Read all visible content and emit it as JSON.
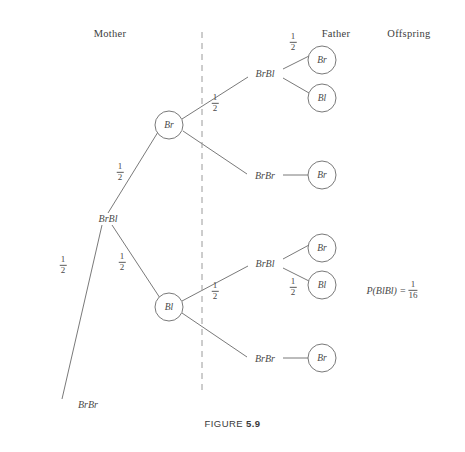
{
  "figure": {
    "caption_word": "FIGURE",
    "caption_number": "5.9"
  },
  "headers": [
    {
      "label": "Mother",
      "x": 110,
      "y": 28
    },
    {
      "label": "Father",
      "x": 336,
      "y": 28
    },
    {
      "label": "Offspring",
      "x": 409,
      "y": 28
    }
  ],
  "divider": {
    "name": "mother-father-divider",
    "x": 202,
    "y1": 32,
    "y2": 392
  },
  "probability": {
    "expression": "P(BlBl)",
    "equals": "=",
    "numerator": "1",
    "denominator": "16",
    "x": 392,
    "y": 290
  },
  "nodes": [
    {
      "id": "mother-genotype",
      "label": "BrBl",
      "x": 108,
      "y": 218,
      "shape": "text"
    },
    {
      "id": "mother-gamete-br",
      "label": "Br",
      "x": 169,
      "y": 125,
      "shape": "circle",
      "r": 14
    },
    {
      "id": "mother-gamete-bl",
      "label": "Bl",
      "x": 169,
      "y": 307,
      "shape": "circle",
      "r": 14
    },
    {
      "id": "mother-outcome-brbr",
      "label": "BrBr",
      "x": 88,
      "y": 404,
      "shape": "text"
    },
    {
      "id": "father-top-brbl",
      "label": "BrBl",
      "x": 265,
      "y": 73,
      "shape": "text"
    },
    {
      "id": "father-top-brbr",
      "label": "BrBr",
      "x": 265,
      "y": 175,
      "shape": "text"
    },
    {
      "id": "father-bottom-brbl",
      "label": "BrBl",
      "x": 265,
      "y": 263,
      "shape": "text"
    },
    {
      "id": "father-bottom-brbr",
      "label": "BrBr",
      "x": 265,
      "y": 358,
      "shape": "text"
    },
    {
      "id": "offspring-1-br",
      "label": "Br",
      "x": 322,
      "y": 60,
      "shape": "circle",
      "r": 14
    },
    {
      "id": "offspring-2-bl",
      "label": "Bl",
      "x": 322,
      "y": 98,
      "shape": "circle",
      "r": 14
    },
    {
      "id": "offspring-3-br",
      "label": "Br",
      "x": 322,
      "y": 175,
      "shape": "circle",
      "r": 14
    },
    {
      "id": "offspring-4-br",
      "label": "Br",
      "x": 322,
      "y": 248,
      "shape": "circle",
      "r": 14
    },
    {
      "id": "offspring-5-bl",
      "label": "Bl",
      "x": 322,
      "y": 285,
      "shape": "circle",
      "r": 14
    },
    {
      "id": "offspring-6-br",
      "label": "Br",
      "x": 322,
      "y": 358,
      "shape": "circle",
      "r": 14
    }
  ],
  "edges": [
    {
      "id": "edge-mother-to-br",
      "x1": 108,
      "y1": 213,
      "x2": 158,
      "y2": 132
    },
    {
      "id": "edge-mother-to-bl",
      "x1": 112,
      "y1": 225,
      "x2": 160,
      "y2": 298
    },
    {
      "id": "edge-mother-to-brbr",
      "x1": 102,
      "y1": 225,
      "x2": 62,
      "y2": 399
    },
    {
      "id": "edge-br-to-father-brbl",
      "x1": 182,
      "y1": 119,
      "x2": 248,
      "y2": 77
    },
    {
      "id": "edge-br-to-father-brbr",
      "x1": 183,
      "y1": 131,
      "x2": 247,
      "y2": 174
    },
    {
      "id": "edge-fatherbrbl-to-offspring1",
      "x1": 283,
      "y1": 69,
      "x2": 309,
      "y2": 56
    },
    {
      "id": "edge-fatherbrbl-to-offspring2",
      "x1": 283,
      "y1": 78,
      "x2": 309,
      "y2": 93
    },
    {
      "id": "edge-fatherbrbr-to-offspring3",
      "x1": 283,
      "y1": 175,
      "x2": 308,
      "y2": 175
    },
    {
      "id": "edge-bl-to-father-brbl",
      "x1": 182,
      "y1": 301,
      "x2": 248,
      "y2": 266
    },
    {
      "id": "edge-bl-to-father-brbr",
      "x1": 182,
      "y1": 313,
      "x2": 247,
      "y2": 357
    },
    {
      "id": "edge-fatherbrbl-to-offspring4",
      "x1": 283,
      "y1": 259,
      "x2": 309,
      "y2": 245
    },
    {
      "id": "edge-fatherbrbl-to-offspring5",
      "x1": 283,
      "y1": 268,
      "x2": 309,
      "y2": 281
    },
    {
      "id": "edge-fatherbrbr-to-offspring6",
      "x1": 283,
      "y1": 358,
      "x2": 308,
      "y2": 358
    }
  ],
  "probability_labels": [
    {
      "id": "prob-mother-br",
      "numerator": "1",
      "denominator": "2",
      "x": 120,
      "y": 172
    },
    {
      "id": "prob-mother-bl",
      "numerator": "1",
      "denominator": "2",
      "x": 122,
      "y": 262
    },
    {
      "id": "prob-mother-brbr",
      "numerator": "1",
      "denominator": "2",
      "x": 63,
      "y": 265
    },
    {
      "id": "prob-br-father-brbl",
      "numerator": "1",
      "denominator": "2",
      "x": 215,
      "y": 103
    },
    {
      "id": "prob-offspring-top-br",
      "numerator": "1",
      "denominator": "2",
      "x": 293,
      "y": 42
    },
    {
      "id": "prob-bl-father-brbl",
      "numerator": "1",
      "denominator": "2",
      "x": 215,
      "y": 291
    },
    {
      "id": "prob-offspring-bot-bl",
      "numerator": "1",
      "denominator": "2",
      "x": 293,
      "y": 287
    }
  ],
  "caption_position": {
    "y": 418
  }
}
